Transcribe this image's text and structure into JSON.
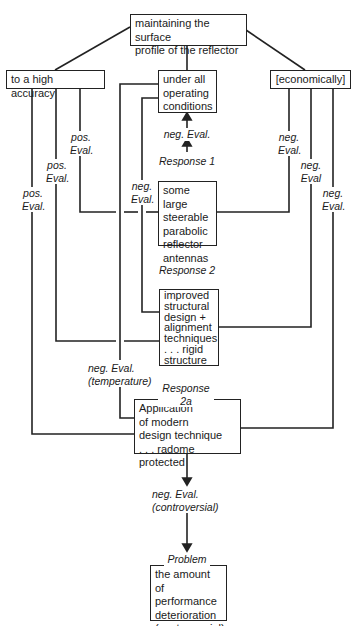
{
  "nodes": {
    "root": "maintaining the surface\nprofile of the reflector",
    "accuracy": "to a high accuracy",
    "conditions": "under all\noperating\nconditions",
    "economically": "[economically]",
    "antennas": "some large\nsteerable\nparabolic\nreflector\nantennas",
    "improved": "improved\nstructural\ndesign +\nalignment\ntechniques\n. . . rigid\nstructure",
    "application": "Application\nof modern\ndesign technique\n. . . radome protected",
    "problem": "the amount of\nperformance\ndeterioration\n(controversial)"
  },
  "labels": {
    "resp1_eval": "neg. Eval.",
    "response1": "Response 1",
    "response2": "Response 2",
    "response2a": "Response 2a",
    "pos_eval_1": "pos.\nEval.",
    "pos_eval_2": "pos.\nEval.",
    "pos_eval_3": "pos.\nEval.",
    "neg_eval_left": "neg.\nEval.",
    "neg_eval_r1": "neg.\nEval.",
    "neg_eval_r2": "neg.\nEval",
    "neg_eval_r3": "neg.\nEval.",
    "neg_eval_temp": "neg. Eval.\n(temperature)",
    "neg_eval_contro": "neg. Eval.\n(controversial)",
    "problem": "Problem"
  },
  "colors": {
    "line": "#222222",
    "background": "#ffffff"
  }
}
